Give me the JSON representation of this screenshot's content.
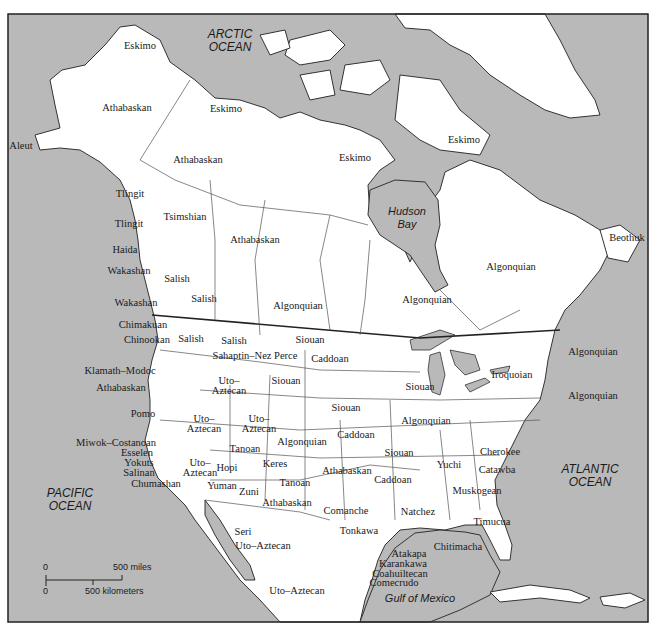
{
  "map": {
    "colors": {
      "ocean": "#b9b9b9",
      "land": "#ffffff",
      "border": "#555555",
      "frame": "#222222"
    },
    "oceans": {
      "arctic": "ARCTIC\nOCEAN",
      "pacific": "PACIFIC\nOCEAN",
      "atlantic": "ATLANTIC\nOCEAN",
      "hudson": "Hudson\nBay",
      "gulf": "Gulf of Mexico"
    },
    "scale_bar": {
      "top_zero": "0",
      "miles": "500 miles",
      "bottom_zero": "0",
      "kilometers": "500 kilometers"
    },
    "labels": [
      {
        "text": "Eskimo",
        "x": 140,
        "y": 45
      },
      {
        "text": "Athabaskan",
        "x": 127,
        "y": 107
      },
      {
        "text": "Aleut",
        "x": 21,
        "y": 145
      },
      {
        "text": "Eskimo",
        "x": 226,
        "y": 108
      },
      {
        "text": "Athabaskan",
        "x": 198,
        "y": 159
      },
      {
        "text": "Eskimo",
        "x": 355,
        "y": 157
      },
      {
        "text": "Eskimo",
        "x": 464,
        "y": 139
      },
      {
        "text": "Tlingit",
        "x": 130,
        "y": 193
      },
      {
        "text": "Tlingit",
        "x": 129,
        "y": 223
      },
      {
        "text": "Tsimshian",
        "x": 185,
        "y": 216
      },
      {
        "text": "Athabaskan",
        "x": 255,
        "y": 239
      },
      {
        "text": "Haida",
        "x": 125,
        "y": 249
      },
      {
        "text": "Wakashan",
        "x": 129,
        "y": 270
      },
      {
        "text": "Salish",
        "x": 177,
        "y": 278
      },
      {
        "text": "Salish",
        "x": 204,
        "y": 298
      },
      {
        "text": "Wakashan",
        "x": 136,
        "y": 302
      },
      {
        "text": "Algonquian",
        "x": 298,
        "y": 305
      },
      {
        "text": "Algonquian",
        "x": 427,
        "y": 299
      },
      {
        "text": "Algonquian",
        "x": 511,
        "y": 266
      },
      {
        "text": "Beothuk",
        "x": 627,
        "y": 237
      },
      {
        "text": "Chimakuan",
        "x": 143,
        "y": 324
      },
      {
        "text": "Chinookan",
        "x": 147,
        "y": 339
      },
      {
        "text": "Salish",
        "x": 191,
        "y": 338
      },
      {
        "text": "Salish",
        "x": 234,
        "y": 340
      },
      {
        "text": "Siouan",
        "x": 310,
        "y": 339
      },
      {
        "text": "Sahaptin–Nez Perce",
        "x": 255,
        "y": 355
      },
      {
        "text": "Caddoan",
        "x": 330,
        "y": 358
      },
      {
        "text": "Algonquian",
        "x": 593,
        "y": 351
      },
      {
        "text": "Klamath–Modoc",
        "x": 120,
        "y": 370
      },
      {
        "text": "Uto–",
        "x": 229,
        "y": 380
      },
      {
        "text": "Aztecan",
        "x": 229,
        "y": 390
      },
      {
        "text": "Siouan",
        "x": 286,
        "y": 380
      },
      {
        "text": "Siouan",
        "x": 420,
        "y": 386
      },
      {
        "text": "Iroquoian",
        "x": 512,
        "y": 374
      },
      {
        "text": "Athabaskan",
        "x": 121,
        "y": 387
      },
      {
        "text": "Algonquian",
        "x": 593,
        "y": 395
      },
      {
        "text": "Siouan",
        "x": 346,
        "y": 407
      },
      {
        "text": "Pomo",
        "x": 143,
        "y": 413
      },
      {
        "text": "Uto–",
        "x": 204,
        "y": 418
      },
      {
        "text": "Aztecan",
        "x": 204,
        "y": 428
      },
      {
        "text": "Uto–",
        "x": 259,
        "y": 418
      },
      {
        "text": "Aztecan",
        "x": 259,
        "y": 428
      },
      {
        "text": "Algonquian",
        "x": 426,
        "y": 420
      },
      {
        "text": "Caddoan",
        "x": 356,
        "y": 434
      },
      {
        "text": "Algonquian",
        "x": 302,
        "y": 441
      },
      {
        "text": "Tanoan",
        "x": 245,
        "y": 448
      },
      {
        "text": "Miwok–Costanoan",
        "x": 116,
        "y": 442
      },
      {
        "text": "Esselen",
        "x": 137,
        "y": 452
      },
      {
        "text": "Cherokee",
        "x": 500,
        "y": 451
      },
      {
        "text": "Siouan",
        "x": 399,
        "y": 452
      },
      {
        "text": "Yokuts",
        "x": 139,
        "y": 462
      },
      {
        "text": "Keres",
        "x": 275,
        "y": 463
      },
      {
        "text": "Yuchi",
        "x": 449,
        "y": 464
      },
      {
        "text": "Hopi",
        "x": 227,
        "y": 467
      },
      {
        "text": "Salinan",
        "x": 139,
        "y": 472
      },
      {
        "text": "Uto–",
        "x": 200,
        "y": 462
      },
      {
        "text": "Aztecan",
        "x": 200,
        "y": 472
      },
      {
        "text": "Athabaskan",
        "x": 347,
        "y": 470
      },
      {
        "text": "Catawba",
        "x": 497,
        "y": 469
      },
      {
        "text": "Chumashan",
        "x": 156,
        "y": 483
      },
      {
        "text": "Tanoan",
        "x": 295,
        "y": 482
      },
      {
        "text": "Caddoan",
        "x": 393,
        "y": 479
      },
      {
        "text": "Yuman",
        "x": 222,
        "y": 485
      },
      {
        "text": "Muskogean",
        "x": 477,
        "y": 490
      },
      {
        "text": "Zuni",
        "x": 249,
        "y": 491
      },
      {
        "text": "Athabaskan",
        "x": 287,
        "y": 502
      },
      {
        "text": "Comanche",
        "x": 346,
        "y": 510
      },
      {
        "text": "Natchez",
        "x": 418,
        "y": 511
      },
      {
        "text": "Tonkawa",
        "x": 359,
        "y": 530
      },
      {
        "text": "Timucua",
        "x": 492,
        "y": 521
      },
      {
        "text": "Seri",
        "x": 243,
        "y": 531
      },
      {
        "text": "Uto–Aztecan",
        "x": 263,
        "y": 545
      },
      {
        "text": "Chitimacha",
        "x": 458,
        "y": 546
      },
      {
        "text": "Atakapa",
        "x": 409,
        "y": 553
      },
      {
        "text": "Karankawa",
        "x": 403,
        "y": 563
      },
      {
        "text": "Coahuiltecan",
        "x": 400,
        "y": 573
      },
      {
        "text": "Comecrudo",
        "x": 394,
        "y": 582
      },
      {
        "text": "Uto–Aztecan",
        "x": 297,
        "y": 590
      }
    ]
  }
}
